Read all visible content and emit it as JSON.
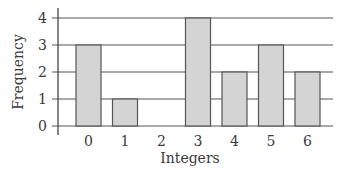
{
  "chart_data": {
    "type": "bar",
    "title": "",
    "xlabel": "Integers",
    "ylabel": "Frequency",
    "categories": [
      "0",
      "1",
      "2",
      "3",
      "4",
      "5",
      "6"
    ],
    "values": [
      3,
      1,
      0,
      4,
      2,
      3,
      2
    ],
    "ylim": [
      0,
      4
    ],
    "yticks": [
      0,
      1,
      2,
      3,
      4
    ],
    "grid": true,
    "legend": null,
    "bar_color": "#d4d4d4",
    "bar_edge_color": "#555555",
    "grid_color": "#555555"
  }
}
